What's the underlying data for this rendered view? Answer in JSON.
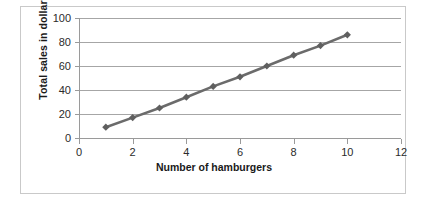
{
  "clipped_header_text": "",
  "chart_data": {
    "type": "line",
    "title": "",
    "xlabel": "Number of hamburgers",
    "ylabel": "Total sales in dollars",
    "x": [
      1,
      2,
      3,
      4,
      5,
      6,
      7,
      8,
      9,
      10
    ],
    "values": [
      9,
      17,
      25,
      34,
      43,
      51,
      60,
      69,
      77,
      86
    ],
    "series": [
      {
        "name": "Total sales",
        "values": [
          9,
          17,
          25,
          34,
          43,
          51,
          60,
          69,
          77,
          86
        ]
      }
    ],
    "xlim": [
      0,
      12
    ],
    "ylim": [
      0,
      100
    ],
    "x_ticks": [
      "0",
      "2",
      "4",
      "6",
      "8",
      "10",
      "12"
    ],
    "x_tick_values": [
      0,
      2,
      4,
      6,
      8,
      10,
      12
    ],
    "y_ticks": [
      "0",
      "20",
      "40",
      "60",
      "80",
      "100"
    ],
    "y_tick_values": [
      0,
      20,
      40,
      60,
      80,
      100
    ],
    "grid": "horizontal",
    "legend": "none",
    "marker": "diamond",
    "line_color": "#6b6b6b",
    "marker_color": "#5f5f5f",
    "gridline_color": "#a6a6a6",
    "plot_background": "#ffffff",
    "border_color": "#c9c9c9"
  }
}
